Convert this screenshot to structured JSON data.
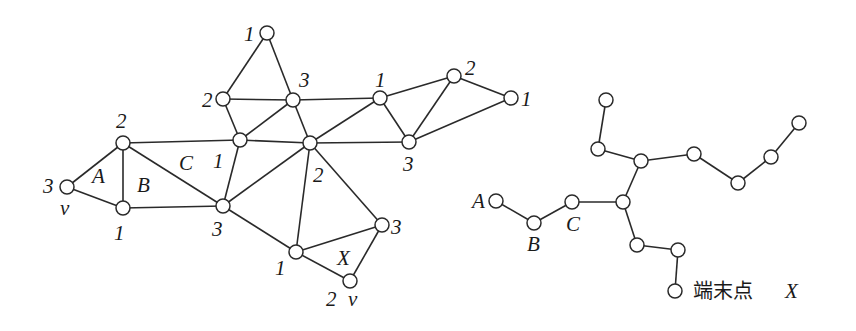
{
  "figure": {
    "left_graph": {
      "description": "3-colored triangulated planar graph",
      "nodes": [
        {
          "id": "v_left",
          "x": 67,
          "y": 187,
          "color_label": "3",
          "lx": 43,
          "ly": 193,
          "extra": "v",
          "ex": 60,
          "ey": 215
        },
        {
          "id": "a_top",
          "x": 123,
          "y": 143,
          "color_label": "2",
          "lx": 116,
          "ly": 128
        },
        {
          "id": "b_bot",
          "x": 123,
          "y": 208,
          "color_label": "1",
          "lx": 114,
          "ly": 240
        },
        {
          "id": "c_bot",
          "x": 223,
          "y": 206,
          "color_label": "3",
          "lx": 212,
          "ly": 236
        },
        {
          "id": "c_mid",
          "x": 240,
          "y": 140,
          "color_label": "1",
          "lx": 213,
          "ly": 168
        },
        {
          "id": "top_left",
          "x": 223,
          "y": 99,
          "color_label": "2",
          "lx": 202,
          "ly": 107
        },
        {
          "id": "top",
          "x": 267,
          "y": 33,
          "color_label": "1",
          "lx": 244,
          "ly": 41
        },
        {
          "id": "top_mid",
          "x": 293,
          "y": 100,
          "color_label": "3",
          "lx": 299,
          "ly": 87
        },
        {
          "id": "hub",
          "x": 310,
          "y": 143,
          "color_label": "2",
          "lx": 313,
          "ly": 182
        },
        {
          "id": "right_top",
          "x": 380,
          "y": 98,
          "color_label": "1",
          "lx": 375,
          "ly": 87
        },
        {
          "id": "right_bot",
          "x": 409,
          "y": 142,
          "color_label": "3",
          "lx": 403,
          "ly": 171
        },
        {
          "id": "far_top",
          "x": 454,
          "y": 76,
          "color_label": "2",
          "lx": 465,
          "ly": 75
        },
        {
          "id": "far_right",
          "x": 511,
          "y": 98,
          "color_label": "1",
          "lx": 521,
          "ly": 106
        },
        {
          "id": "x_left",
          "x": 296,
          "y": 252,
          "color_label": "1",
          "lx": 275,
          "ly": 275
        },
        {
          "id": "x_right",
          "x": 382,
          "y": 225,
          "color_label": "3",
          "lx": 391,
          "ly": 234
        },
        {
          "id": "x_bot",
          "x": 350,
          "y": 281,
          "color_label": "2",
          "lx": 326,
          "ly": 306,
          "extra": "v",
          "ex": 348,
          "ey": 306
        }
      ],
      "edges": [
        [
          "v_left",
          "a_top"
        ],
        [
          "v_left",
          "b_bot"
        ],
        [
          "a_top",
          "b_bot"
        ],
        [
          "a_top",
          "c_mid"
        ],
        [
          "a_top",
          "c_bot"
        ],
        [
          "b_bot",
          "c_bot"
        ],
        [
          "c_bot",
          "c_mid"
        ],
        [
          "c_bot",
          "hub"
        ],
        [
          "c_bot",
          "x_left"
        ],
        [
          "c_mid",
          "top_left"
        ],
        [
          "c_mid",
          "top_mid"
        ],
        [
          "c_mid",
          "hub"
        ],
        [
          "top_left",
          "top"
        ],
        [
          "top_left",
          "top_mid"
        ],
        [
          "top",
          "top_mid"
        ],
        [
          "top_mid",
          "hub"
        ],
        [
          "top_mid",
          "right_top"
        ],
        [
          "hub",
          "right_top"
        ],
        [
          "hub",
          "right_bot"
        ],
        [
          "hub",
          "x_left"
        ],
        [
          "hub",
          "x_right"
        ],
        [
          "right_top",
          "right_bot"
        ],
        [
          "right_top",
          "far_top"
        ],
        [
          "right_bot",
          "far_top"
        ],
        [
          "right_bot",
          "far_right"
        ],
        [
          "far_top",
          "far_right"
        ],
        [
          "x_left",
          "x_right"
        ],
        [
          "x_left",
          "x_bot"
        ],
        [
          "x_right",
          "x_bot"
        ]
      ],
      "face_labels": [
        {
          "text": "A",
          "x": 92,
          "y": 183
        },
        {
          "text": "B",
          "x": 137,
          "y": 192
        },
        {
          "text": "C",
          "x": 179,
          "y": 170
        },
        {
          "text": "X",
          "x": 337,
          "y": 265
        }
      ]
    },
    "right_tree": {
      "description": "Dual tree with terminal point X",
      "nodes": [
        {
          "id": "tA",
          "x": 496,
          "y": 201,
          "label": "A",
          "lx": 472,
          "ly": 208
        },
        {
          "id": "tB",
          "x": 534,
          "y": 223,
          "label": "B",
          "lx": 527,
          "ly": 251
        },
        {
          "id": "tC",
          "x": 572,
          "y": 202,
          "label": "C",
          "lx": 566,
          "ly": 231
        },
        {
          "id": "j1",
          "x": 623,
          "y": 202
        },
        {
          "id": "j2",
          "x": 641,
          "y": 161
        },
        {
          "id": "u1",
          "x": 598,
          "y": 149
        },
        {
          "id": "u2",
          "x": 606,
          "y": 100
        },
        {
          "id": "r1",
          "x": 694,
          "y": 154
        },
        {
          "id": "r2",
          "x": 738,
          "y": 183
        },
        {
          "id": "r3",
          "x": 771,
          "y": 157
        },
        {
          "id": "r4",
          "x": 799,
          "y": 123
        },
        {
          "id": "d1",
          "x": 637,
          "y": 245
        },
        {
          "id": "d2",
          "x": 678,
          "y": 250
        },
        {
          "id": "tX",
          "x": 675,
          "y": 291
        }
      ],
      "edges": [
        [
          "tA",
          "tB"
        ],
        [
          "tB",
          "tC"
        ],
        [
          "tC",
          "j1"
        ],
        [
          "j1",
          "j2"
        ],
        [
          "j2",
          "u1"
        ],
        [
          "u1",
          "u2"
        ],
        [
          "j2",
          "r1"
        ],
        [
          "r1",
          "r2"
        ],
        [
          "r2",
          "r3"
        ],
        [
          "r3",
          "r4"
        ],
        [
          "j1",
          "d1"
        ],
        [
          "d1",
          "d2"
        ],
        [
          "d2",
          "tX"
        ]
      ],
      "terminal_label": {
        "text": "端末点",
        "x": 693,
        "y": 298
      },
      "terminal_x": {
        "text": "X",
        "x": 785,
        "y": 298
      }
    },
    "colors": {
      "stroke": "#2a2a2a",
      "fill": "#ffffff",
      "text": "#1a1a1a"
    },
    "node_radius": 7
  }
}
